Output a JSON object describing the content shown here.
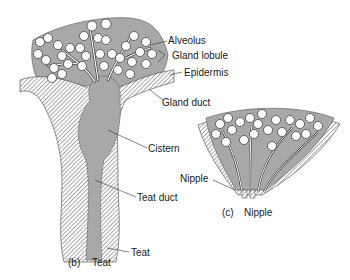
{
  "figure_b": {
    "caption_letter": "(b)",
    "caption_title": "Teat",
    "labels": {
      "alveolus": "Alveolus",
      "gland_lobule": "Gland lobule",
      "epidermis": "Epidermis",
      "gland_duct": "Gland duct",
      "cistern": "Cistern",
      "teat_duct": "Teat duct",
      "teat": "Teat"
    }
  },
  "figure_c": {
    "caption_letter": "(c)",
    "caption_title": "Nipple",
    "labels": {
      "nipple": "Nipple"
    }
  },
  "colors": {
    "tissue_gray": "#a8a8a8",
    "alveolus_fill": "#ffffff",
    "outline": "#333333"
  }
}
